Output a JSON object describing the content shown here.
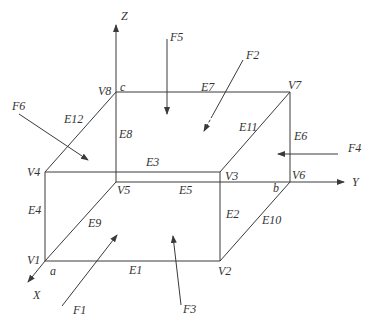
{
  "diagram": {
    "title": "",
    "axes": [
      {
        "id": "Z",
        "label": "Z",
        "from": [
          116,
          92
        ],
        "to": [
          116,
          25
        ],
        "label_pos": [
          121,
          20
        ]
      },
      {
        "id": "Y",
        "label": "Y",
        "from": [
          290,
          182
        ],
        "to": [
          344,
          182
        ],
        "label_pos": [
          352,
          186
        ]
      },
      {
        "id": "X",
        "label": "X",
        "from": [
          45,
          261
        ],
        "to": [
          28,
          282
        ],
        "label_pos": [
          33,
          299
        ]
      }
    ],
    "vertices": [
      {
        "id": "V1",
        "label": "V1",
        "pos": [
          45,
          261
        ],
        "label_pos": [
          27,
          264
        ]
      },
      {
        "id": "V2",
        "label": "V2",
        "pos": [
          220,
          261
        ],
        "label_pos": [
          218,
          275
        ]
      },
      {
        "id": "V3",
        "label": "V3",
        "pos": [
          220,
          172
        ],
        "label_pos": [
          225,
          180
        ]
      },
      {
        "id": "V4",
        "label": "V4",
        "pos": [
          45,
          172
        ],
        "label_pos": [
          27,
          176
        ]
      },
      {
        "id": "V5",
        "label": "V5",
        "pos": [
          116,
          182
        ],
        "label_pos": [
          117,
          194
        ]
      },
      {
        "id": "V6",
        "label": "V6",
        "pos": [
          290,
          182
        ],
        "label_pos": [
          292,
          179
        ]
      },
      {
        "id": "V7",
        "label": "V7",
        "pos": [
          290,
          92
        ],
        "label_pos": [
          288,
          89
        ]
      },
      {
        "id": "V8",
        "label": "V8",
        "pos": [
          116,
          92
        ],
        "label_pos": [
          98,
          95
        ]
      }
    ],
    "corner_labels": [
      {
        "label": "a",
        "pos": [
          50,
          275
        ]
      },
      {
        "label": "b",
        "pos": [
          273,
          192
        ]
      },
      {
        "label": "c",
        "pos": [
          120,
          91
        ]
      }
    ],
    "edges": [
      {
        "id": "E1",
        "label": "E1",
        "from": "V1",
        "to": "V2",
        "label_pos": [
          129,
          274
        ],
        "style": "solid"
      },
      {
        "id": "E2",
        "label": "E2",
        "from": "V2",
        "to": "V3",
        "label_pos": [
          226,
          218
        ],
        "style": "solid"
      },
      {
        "id": "E3",
        "label": "E3",
        "from": "V3",
        "to": "V4",
        "label_pos": [
          146,
          166
        ],
        "style": "solid"
      },
      {
        "id": "E4",
        "label": "E4",
        "from": "V4",
        "to": "V1",
        "label_pos": [
          28,
          214
        ],
        "style": "solid"
      },
      {
        "id": "E5",
        "label": "E5",
        "from": "V5",
        "to": "V6",
        "label_pos": [
          179,
          194
        ],
        "style": "solid"
      },
      {
        "id": "E6",
        "label": "E6",
        "from": "V6",
        "to": "V7",
        "label_pos": [
          294,
          140
        ],
        "style": "solid"
      },
      {
        "id": "E7",
        "label": "E7",
        "from": "V7",
        "to": "V8",
        "label_pos": [
          201,
          91
        ],
        "style": "solid"
      },
      {
        "id": "E8",
        "label": "E8",
        "from": "V8",
        "to": "V5",
        "label_pos": [
          119,
          138
        ],
        "style": "solid"
      },
      {
        "id": "E9",
        "label": "E9",
        "from": "V1",
        "to": "V5",
        "label_pos": [
          88,
          227
        ],
        "style": "solid"
      },
      {
        "id": "E10",
        "label": "E10",
        "from": "V2",
        "to": "V6",
        "label_pos": [
          262,
          224
        ],
        "style": "solid"
      },
      {
        "id": "E11",
        "label": "E11",
        "from": "V3",
        "to": "V7",
        "label_pos": [
          239,
          131
        ],
        "style": "solid"
      },
      {
        "id": "E12",
        "label": "E12",
        "from": "V4",
        "to": "V8",
        "label_pos": [
          64,
          123
        ],
        "style": "solid"
      }
    ],
    "forces": [
      {
        "id": "F1",
        "label": "F1",
        "from": [
          62,
          306
        ],
        "to": [
          117,
          235
        ],
        "label_pos": [
          73,
          314
        ],
        "style": "solid"
      },
      {
        "id": "F2",
        "label": "F2",
        "from": [
          243,
          60
        ],
        "to": [
          204,
          131
        ],
        "label_pos": [
          246,
          59
        ],
        "style": "dash-tail"
      },
      {
        "id": "F3",
        "label": "F3",
        "from": [
          181,
          305
        ],
        "to": [
          173,
          236
        ],
        "label_pos": [
          183,
          313
        ],
        "style": "solid"
      },
      {
        "id": "F4",
        "label": "F4",
        "from": [
          338,
          154
        ],
        "to": [
          278,
          154
        ],
        "label_pos": [
          348,
          152
        ],
        "style": "solid"
      },
      {
        "id": "F5",
        "label": "F5",
        "from": [
          167,
          39
        ],
        "to": [
          167,
          114
        ],
        "label_pos": [
          170,
          41
        ],
        "style": "solid"
      },
      {
        "id": "F6",
        "label": "F6",
        "from": [
          19,
          114
        ],
        "to": [
          88,
          160
        ],
        "label_pos": [
          12,
          110
        ],
        "style": "solid"
      }
    ],
    "colors": {
      "line": "#3a3a3a",
      "text": "#333333",
      "background": "#ffffff"
    }
  }
}
